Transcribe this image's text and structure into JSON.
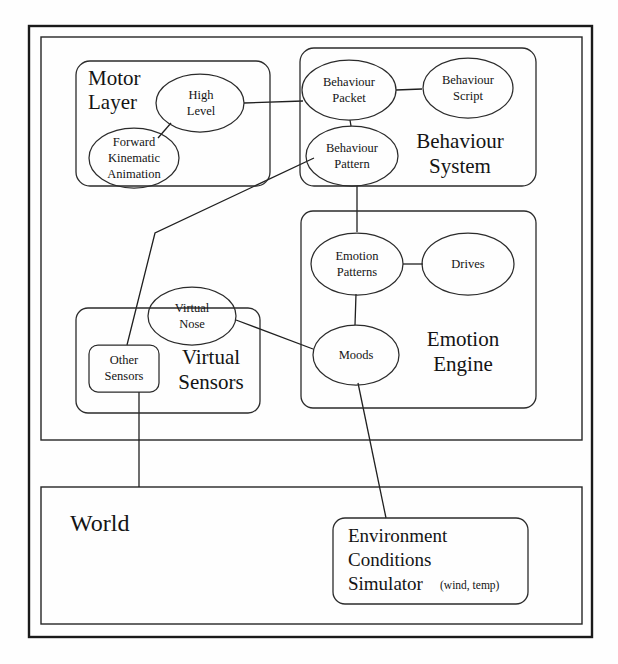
{
  "figure": {
    "kind": "architecture-block-diagram",
    "background_color": "#fefefe",
    "line_color": "#1f1f1f",
    "text_color": "#141414"
  },
  "containers": {
    "agent": {
      "label": ""
    },
    "world": {
      "label": "World"
    }
  },
  "modules": {
    "motor_layer": {
      "title_line1": "Motor",
      "title_line2": "Layer"
    },
    "behaviour_system": {
      "title_line1": "Behaviour",
      "title_line2": "System"
    },
    "virtual_sensors": {
      "title_line1": "Virtual",
      "title_line2": "Sensors"
    },
    "emotion_engine": {
      "title_line1": "Emotion",
      "title_line2": "Engine"
    }
  },
  "nodes": {
    "high_level": {
      "line1": "High",
      "line2": "Level"
    },
    "forward_kinematic_animation": {
      "line1": "Forward",
      "line2": "Kinematic",
      "line3": "Animation"
    },
    "behaviour_packet": {
      "line1": "Behaviour",
      "line2": "Packet"
    },
    "behaviour_script": {
      "line1": "Behaviour",
      "line2": "Script"
    },
    "behaviour_pattern": {
      "line1": "Behaviour",
      "line2": "Pattern"
    },
    "emotion_patterns": {
      "line1": "Emotion",
      "line2": "Patterns"
    },
    "drives": {
      "line1": "Drives"
    },
    "moods": {
      "line1": "Moods"
    },
    "virtual_nose": {
      "line1": "Virtual",
      "line2": "Nose"
    },
    "other_sensors": {
      "line1": "Other",
      "line2": "Sensors"
    },
    "environment_conditions_simulator": {
      "line1": "Environment",
      "line2": "Conditions",
      "line3": "Simulator",
      "note": "(wind, temp)"
    }
  }
}
